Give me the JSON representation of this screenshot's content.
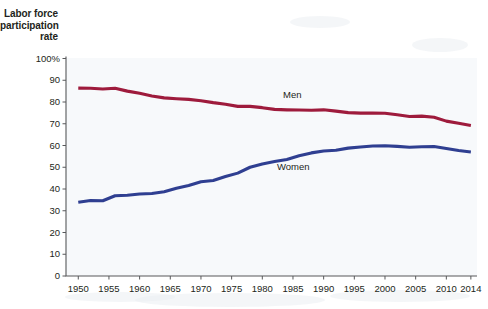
{
  "chart_data": {
    "type": "line",
    "title": "",
    "ylabel": "Labor force participation rate",
    "xlabel": "",
    "ylim": [
      0,
      100
    ],
    "xlim": [
      1948,
      2015
    ],
    "grid": false,
    "legend_position": "inline-annotations",
    "y_ticks": [
      "100%",
      "90",
      "80",
      "70",
      "60",
      "50",
      "40",
      "30",
      "20",
      "10",
      "0"
    ],
    "y_tick_values": [
      100,
      90,
      80,
      70,
      60,
      50,
      40,
      30,
      20,
      10,
      0
    ],
    "x_ticks": [
      "1950",
      "1955",
      "1960",
      "1965",
      "1970",
      "1975",
      "1980",
      "1985",
      "1990",
      "1995",
      "2000",
      "2005",
      "2010",
      "2014"
    ],
    "x_tick_values": [
      1950,
      1955,
      1960,
      1965,
      1970,
      1975,
      1980,
      1985,
      1990,
      1995,
      2000,
      2005,
      2010,
      2014
    ],
    "series": [
      {
        "name": "Men",
        "color": "#9e1b3c",
        "label": "Men",
        "x": [
          1950,
          1952,
          1954,
          1956,
          1958,
          1960,
          1962,
          1964,
          1966,
          1968,
          1970,
          1972,
          1974,
          1976,
          1978,
          1980,
          1982,
          1984,
          1986,
          1988,
          1990,
          1992,
          1994,
          1996,
          1998,
          2000,
          2002,
          2004,
          2006,
          2008,
          2010,
          2012,
          2014
        ],
        "values": [
          86.4,
          86.3,
          86.0,
          86.3,
          85.0,
          84.0,
          82.8,
          81.9,
          81.5,
          81.2,
          80.6,
          79.7,
          79.0,
          78.0,
          78.0,
          77.4,
          76.6,
          76.4,
          76.3,
          76.2,
          76.4,
          75.8,
          75.1,
          74.9,
          74.9,
          74.8,
          74.1,
          73.3,
          73.5,
          73.0,
          71.2,
          70.2,
          69.2
        ]
      },
      {
        "name": "Women",
        "color": "#2f3f91",
        "label": "Women",
        "x": [
          1950,
          1952,
          1954,
          1956,
          1958,
          1960,
          1962,
          1964,
          1966,
          1968,
          1970,
          1972,
          1974,
          1976,
          1978,
          1980,
          1982,
          1984,
          1986,
          1988,
          1990,
          1992,
          1994,
          1996,
          1998,
          2000,
          2002,
          2004,
          2006,
          2008,
          2010,
          2012,
          2014
        ],
        "values": [
          33.9,
          34.7,
          34.6,
          36.9,
          37.1,
          37.7,
          37.9,
          38.7,
          40.3,
          41.6,
          43.3,
          43.9,
          45.7,
          47.3,
          50.0,
          51.5,
          52.6,
          53.6,
          55.3,
          56.6,
          57.5,
          57.8,
          58.8,
          59.3,
          59.8,
          59.9,
          59.6,
          59.2,
          59.4,
          59.5,
          58.6,
          57.7,
          57.0
        ]
      }
    ],
    "annotations": [
      {
        "text": "Men",
        "x": 1985,
        "y": 83
      },
      {
        "text": "Women",
        "x": 1985,
        "y": 50
      }
    ]
  },
  "axis_title": {
    "line1": "Labor force",
    "line2": "participation",
    "line3": "rate"
  },
  "colors": {
    "men": "#9e1b3c",
    "women": "#2f3f91",
    "axis": "#58595b",
    "text": "#231f20",
    "plot_background": "#f7f9fb",
    "page_background": "#ffffff"
  }
}
